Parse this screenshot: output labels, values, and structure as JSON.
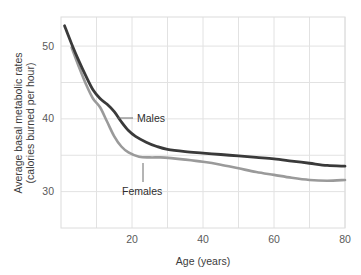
{
  "chart_data": {
    "type": "line",
    "title": "",
    "xlabel": "Age (years)",
    "ylabel": "Average basal metabolic rates (calories burned per hour)",
    "ylabel_line1": "Average basal metabolic rates",
    "ylabel_line2": "(calories burned per hour)",
    "xlim": [
      0,
      80
    ],
    "ylim": [
      25,
      54
    ],
    "xticks": [
      20,
      40,
      60,
      80
    ],
    "xtick_labels": [
      "20",
      "40",
      "60",
      "80"
    ],
    "yticks": [
      30,
      40,
      50
    ],
    "ytick_labels": [
      "30",
      "40",
      "50"
    ],
    "x_gridlines": [
      10,
      20,
      30,
      40,
      50,
      60,
      70,
      80
    ],
    "y_gridlines": [
      30,
      35,
      40,
      45,
      50
    ],
    "grid": true,
    "legend_position": "inline-annotations",
    "series": [
      {
        "name": "Males",
        "color": "#3a3a3a",
        "label": "Males",
        "x": [
          1,
          3,
          5,
          7,
          9,
          11,
          13,
          15,
          17,
          19,
          21,
          24,
          27,
          30,
          35,
          40,
          45,
          50,
          55,
          60,
          65,
          70,
          75,
          80
        ],
        "values": [
          52.8,
          50.3,
          48.0,
          45.9,
          44.0,
          42.8,
          42.0,
          41.0,
          39.6,
          38.4,
          37.6,
          36.8,
          36.2,
          35.8,
          35.5,
          35.3,
          35.1,
          34.9,
          34.7,
          34.5,
          34.2,
          33.9,
          33.6,
          33.5
        ]
      },
      {
        "name": "Females",
        "color": "#9a9a9a",
        "label": "Females",
        "x": [
          3,
          5,
          7,
          9,
          11,
          13,
          15,
          17,
          19,
          22,
          25,
          28,
          31,
          35,
          40,
          45,
          50,
          55,
          60,
          65,
          70,
          75,
          80
        ],
        "values": [
          49.8,
          47.2,
          44.8,
          42.8,
          41.6,
          39.6,
          37.6,
          36.2,
          35.4,
          34.8,
          34.7,
          34.7,
          34.6,
          34.4,
          34.1,
          33.7,
          33.2,
          32.7,
          32.3,
          31.9,
          31.6,
          31.5,
          31.6
        ]
      }
    ],
    "annotations": [
      {
        "name": "Males",
        "text": "Males",
        "leader": "horizontal-left"
      },
      {
        "name": "Females",
        "text": "Females",
        "leader": "vertical-up"
      }
    ],
    "colors": {
      "males": "#3a3a3a",
      "females": "#9a9a9a",
      "grid": "#e2e2e2",
      "frame": "#dcdcdc",
      "text": "#3c3c3c",
      "tick_text": "#5a5a5a",
      "background": "#ffffff"
    }
  }
}
